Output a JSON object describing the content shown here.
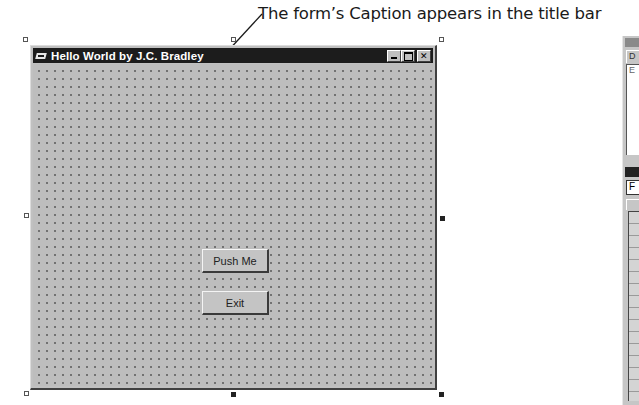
{
  "annotation": {
    "text": "The form’s Caption appears in the title bar"
  },
  "form": {
    "caption": "Hello World by J.C. Bradley",
    "title_buttons": [
      "minimize",
      "maximize",
      "close"
    ],
    "background": "#bdbdbd",
    "titlebar_color": "#1c1c1c",
    "grid": "dotted"
  },
  "buttons": [
    {
      "label": "Push Me"
    },
    {
      "label": "Exit"
    }
  ],
  "side_panel": {
    "project_toolbar_label": "D",
    "project_box_text": "E",
    "properties_object_field": "F"
  }
}
